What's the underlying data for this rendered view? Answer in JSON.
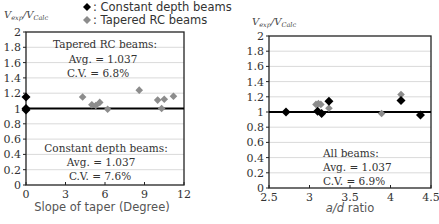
{
  "legend": {
    "items": [
      {
        "marker": "black-diamond",
        "color": "#000000",
        "label": ": Constant depth beams"
      },
      {
        "marker": "gray-diamond",
        "color": "#8c8c8c",
        "label": ": Tapered RC beams"
      }
    ]
  },
  "left": {
    "ylabel_main": "V",
    "ylabel_sub1": "exp",
    "ylabel_sep": "/V",
    "ylabel_sub2": "Calc",
    "xlabel": "Slope of taper (Degree)",
    "ann_top": {
      "title": "Tapered RC beams:",
      "avg": "Avg. = 1.037",
      "cv": "C.V. = 6.8%"
    },
    "ann_bottom": {
      "title": "Constant depth beams:",
      "avg": "Avg. = 1.037",
      "cv": "C.V. = 7.6%"
    }
  },
  "right": {
    "ylabel_main": "V",
    "ylabel_sub1": "exp",
    "ylabel_sep": "/V",
    "ylabel_sub2": "Calc",
    "xlabel_italic": "a/d",
    "xlabel_rest": " ratio",
    "ann": {
      "title": "All beams:",
      "avg": "Avg. = 1.037",
      "cv": "C.V. = 6.9%"
    }
  },
  "chart_data": [
    {
      "type": "scatter",
      "title": "",
      "xlabel": "Slope of taper (Degree)",
      "ylabel": "Vexp/VCalc",
      "xlim": [
        0,
        12
      ],
      "ylim": [
        0,
        2
      ],
      "xticks": [
        0,
        3,
        6,
        9,
        12
      ],
      "yticks": [
        0,
        0.2,
        0.4,
        0.6,
        0.8,
        1,
        1.2,
        1.4,
        1.6,
        1.8,
        2
      ],
      "grid": true,
      "reference_line": 1.0,
      "series": [
        {
          "name": "Constant depth beams",
          "color": "#000000",
          "x": [
            0,
            0,
            0
          ],
          "y": [
            1.15,
            1.0,
            0.98
          ]
        },
        {
          "name": "Tapered RC beams",
          "color": "#8c8c8c",
          "x": [
            4.3,
            5.0,
            5.3,
            5.6,
            6.2,
            8.6,
            10.0,
            10.3,
            10.5,
            11.2
          ],
          "y": [
            1.15,
            1.05,
            1.04,
            1.08,
            0.99,
            1.24,
            1.11,
            1.0,
            1.12,
            1.16
          ]
        }
      ],
      "annotations": [
        "Tapered RC beams: Avg. = 1.037, C.V. = 6.8%",
        "Constant depth beams: Avg. = 1.037, C.V. = 7.6%"
      ]
    },
    {
      "type": "scatter",
      "title": "",
      "xlabel": "a/d ratio",
      "ylabel": "Vexp/VCalc",
      "xlim": [
        2.5,
        4.5
      ],
      "ylim": [
        0,
        2
      ],
      "xticks": [
        2.5,
        3,
        3.5,
        4,
        4.5
      ],
      "yticks": [
        0,
        0.2,
        0.4,
        0.6,
        0.8,
        1,
        1.2,
        1.4,
        1.6,
        1.8,
        2
      ],
      "grid": true,
      "reference_line": 1.0,
      "series": [
        {
          "name": "Constant depth beams",
          "color": "#000000",
          "x": [
            2.71,
            3.1,
            3.15,
            3.24,
            4.13,
            4.37
          ],
          "y": [
            1.0,
            1.01,
            0.98,
            1.14,
            1.15,
            0.96
          ]
        },
        {
          "name": "Tapered RC beams",
          "color": "#8c8c8c",
          "x": [
            3.08,
            3.11,
            3.14,
            3.24,
            3.89,
            4.13
          ],
          "y": [
            1.1,
            1.11,
            1.1,
            1.05,
            0.98,
            1.23
          ]
        }
      ],
      "annotations": [
        "All beams: Avg. = 1.037, C.V. = 6.9%"
      ]
    }
  ]
}
